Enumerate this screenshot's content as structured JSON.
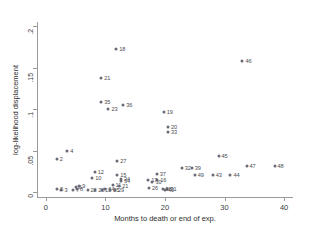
{
  "chart_data": {
    "type": "scatter",
    "title": "",
    "xlabel": "Months to death or end of exp.",
    "ylabel": "log-likelihood displacement",
    "xlim": [
      -1.5,
      41.5
    ],
    "ylim": [
      -0.006,
      0.205
    ],
    "xticks": [
      0,
      10,
      20,
      30,
      40
    ],
    "xticklabels": [
      "0",
      "10",
      "20",
      "30",
      "40"
    ],
    "yticks": [
      0,
      0.05,
      0.1,
      0.15,
      0.2
    ],
    "yticklabels": [
      "0",
      ".05",
      ".1",
      ".15",
      ".2"
    ],
    "grid": false,
    "legend": null,
    "marker_color": "#6b6b78",
    "axis_color": "#9a9a9a",
    "points": [
      {
        "label": "18",
        "x": 11.8,
        "y": 0.173
      },
      {
        "label": "46",
        "x": 33.0,
        "y": 0.158
      },
      {
        "label": "21",
        "x": 9.3,
        "y": 0.138
      },
      {
        "label": "35",
        "x": 9.3,
        "y": 0.108
      },
      {
        "label": "36",
        "x": 13.0,
        "y": 0.105
      },
      {
        "label": "23",
        "x": 10.5,
        "y": 0.1
      },
      {
        "label": "19",
        "x": 19.8,
        "y": 0.096
      },
      {
        "label": "20",
        "x": 20.5,
        "y": 0.078
      },
      {
        "label": "33",
        "x": 20.5,
        "y": 0.072
      },
      {
        "label": "4",
        "x": 3.6,
        "y": 0.049
      },
      {
        "label": "45",
        "x": 29.0,
        "y": 0.043
      },
      {
        "label": "2",
        "x": 1.8,
        "y": 0.04
      },
      {
        "label": "27",
        "x": 12.0,
        "y": 0.038
      },
      {
        "label": "47",
        "x": 33.7,
        "y": 0.031
      },
      {
        "label": "48",
        "x": 38.4,
        "y": 0.031
      },
      {
        "label": "32",
        "x": 22.8,
        "y": 0.029
      },
      {
        "label": "39",
        "x": 24.5,
        "y": 0.029
      },
      {
        "label": "12",
        "x": 8.2,
        "y": 0.024
      },
      {
        "label": "44",
        "x": 31.0,
        "y": 0.021
      },
      {
        "label": "49",
        "x": 25.0,
        "y": 0.02
      },
      {
        "label": "43",
        "x": 28.0,
        "y": 0.021
      },
      {
        "label": "15",
        "x": 12.0,
        "y": 0.02
      },
      {
        "label": "37",
        "x": 18.6,
        "y": 0.022
      },
      {
        "label": "10",
        "x": 7.8,
        "y": 0.017
      },
      {
        "label": "24",
        "x": 12.6,
        "y": 0.016
      },
      {
        "label": "34",
        "x": 12.6,
        "y": 0.013
      },
      {
        "label": "17",
        "x": 17.2,
        "y": 0.014
      },
      {
        "label": "16",
        "x": 18.7,
        "y": 0.014
      },
      {
        "label": "30",
        "x": 17.9,
        "y": 0.012
      },
      {
        "label": "11",
        "x": 11.2,
        "y": 0.009
      },
      {
        "label": "21b",
        "x": 12.3,
        "y": 0.007
      },
      {
        "label": "26",
        "x": 17.3,
        "y": 0.005
      },
      {
        "label": "31",
        "x": 20.4,
        "y": 0.004
      },
      {
        "label": "3",
        "x": 2.6,
        "y": 0.003
      },
      {
        "label": "5",
        "x": 1.9,
        "y": 0.004
      },
      {
        "label": "6",
        "x": 5.0,
        "y": 0.006
      },
      {
        "label": "7",
        "x": 4.6,
        "y": 0.002
      },
      {
        "label": "8",
        "x": 5.2,
        "y": 0.004
      },
      {
        "label": "9",
        "x": 5.6,
        "y": 0.007
      },
      {
        "label": "22",
        "x": 7.0,
        "y": 0.003
      },
      {
        "label": "28",
        "x": 8.3,
        "y": 0.003
      },
      {
        "label": "13",
        "x": 9.4,
        "y": 0.003
      },
      {
        "label": "14",
        "x": 10.0,
        "y": 0.004
      },
      {
        "label": "25",
        "x": 10.8,
        "y": 0.003
      },
      {
        "label": "29",
        "x": 11.6,
        "y": 0.002
      },
      {
        "label": "38",
        "x": 19.6,
        "y": 0.004
      },
      {
        "label": "40",
        "x": 20.0,
        "y": 0.002
      }
    ]
  }
}
